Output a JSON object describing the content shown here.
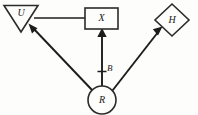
{
  "figure": {
    "background_color": "#fdfdfb",
    "ink_color": "#1c1c1c",
    "width": 198,
    "height": 115
  },
  "diagram": {
    "type": "path-diagram",
    "nodes": [
      {
        "id": "U",
        "label": "U",
        "shape": "triangle-down",
        "cx": 21,
        "cy": 17,
        "half_width": 17,
        "height": 26,
        "label_x": 21,
        "label_y": 15
      },
      {
        "id": "X",
        "label": "X",
        "shape": "rectangle",
        "x": 85,
        "y": 8,
        "width": 33,
        "height": 21,
        "label_x": 101.5,
        "label_y": 18
      },
      {
        "id": "H",
        "label": "H",
        "shape": "diamond",
        "cx": 172,
        "cy": 20,
        "half_width": 17,
        "half_height": 16,
        "label_x": 172,
        "label_y": 20
      },
      {
        "id": "R",
        "label": "R",
        "shape": "circle",
        "cx": 102,
        "cy": 100,
        "r": 14,
        "label_x": 102,
        "label_y": 100
      }
    ],
    "edges": [
      {
        "id": "X-to-U",
        "from": "X",
        "to": "U",
        "style": "plain-line",
        "arrow": "none",
        "path": "M 85 18 L 34 18"
      },
      {
        "id": "R-to-U",
        "from": "R",
        "to": "U",
        "style": "arrow",
        "arrow": "to-U",
        "path": "M 92 91 L 31 27"
      },
      {
        "id": "R-to-X",
        "from": "R",
        "to": "X",
        "style": "arrow",
        "arrow": "to-X",
        "label": "B",
        "path": "M 102 86 L 102 30"
      },
      {
        "id": "R-to-H",
        "from": "R",
        "to": "H",
        "style": "arrow",
        "arrow": "to-H",
        "path": "M 113 91 L 160 30"
      }
    ],
    "edge_labels": [
      {
        "id": "B",
        "text": "B",
        "x": 107,
        "y": 70,
        "tick_x": 102,
        "tick_y": 72
      }
    ]
  }
}
